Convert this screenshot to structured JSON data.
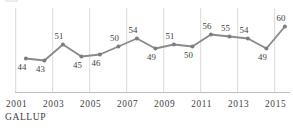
{
  "chart_data": {
    "type": "line",
    "title": "",
    "xlabel": "",
    "ylabel": "",
    "legend": "none",
    "grid": "vertical-only",
    "x_range_years": [
      2001,
      2016
    ],
    "visible_value_range": [
      27,
      69
    ],
    "x_ticks": [
      "2001",
      "2003",
      "2005",
      "2007",
      "2009",
      "2011",
      "2013",
      "2015"
    ],
    "points": [
      {
        "year": 2001,
        "value": 44,
        "label": "44",
        "label_side": "below"
      },
      {
        "year": 2002,
        "value": 43,
        "label": "43",
        "label_side": "below"
      },
      {
        "year": 2003,
        "value": 51,
        "label": "51",
        "label_side": "above"
      },
      {
        "year": 2004,
        "value": 45,
        "label": "45",
        "label_side": "below"
      },
      {
        "year": 2005,
        "value": 46,
        "label": "46",
        "label_side": "below"
      },
      {
        "year": 2006,
        "value": 50,
        "label": "50",
        "label_side": "above"
      },
      {
        "year": 2007,
        "value": 54,
        "label": "54",
        "label_side": "above"
      },
      {
        "year": 2008,
        "value": 49,
        "label": "49",
        "label_side": "below"
      },
      {
        "year": 2009,
        "value": 51,
        "label": "51",
        "label_side": "above"
      },
      {
        "year": 2010,
        "value": 50,
        "label": "50",
        "label_side": "below"
      },
      {
        "year": 2011,
        "value": 56,
        "label": "56",
        "label_side": "above"
      },
      {
        "year": 2012,
        "value": 55,
        "label": "55",
        "label_side": "above"
      },
      {
        "year": 2013,
        "value": 54,
        "label": "54",
        "label_side": "above"
      },
      {
        "year": 2014,
        "value": 49,
        "label": "49",
        "label_side": "below"
      },
      {
        "year": 2015,
        "value": 60,
        "label": "60",
        "label_side": "above"
      }
    ],
    "source": "GALLUP",
    "source_mark": "’",
    "colors": {
      "background": "#ffffff",
      "line": "#8a8a8a",
      "marker": "#7d7d7d",
      "point_label": "#3d3d3d",
      "tick_label": "#3d3d3d",
      "gridline": "#d9d9d9",
      "axis_line": "#bdbdbd",
      "source_text": "#3b3b3b"
    }
  }
}
